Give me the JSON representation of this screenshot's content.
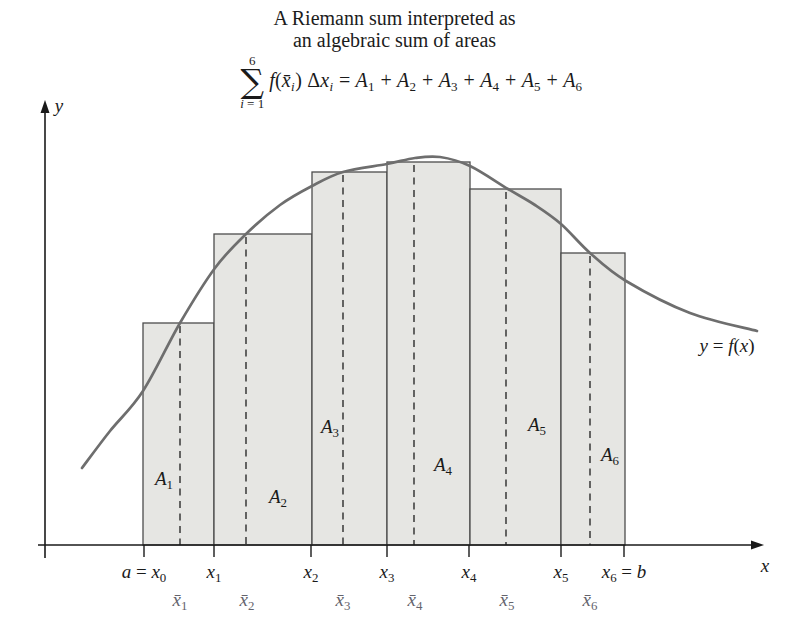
{
  "title": {
    "line1": "A Riemann sum interpreted as",
    "line2": "an algebraic sum of areas"
  },
  "formula": {
    "sum_upper": "6",
    "sum_symbol": "∑",
    "sum_lower_parts": [
      {
        "t": "i",
        "i": 1
      },
      {
        "t": " = 1"
      }
    ],
    "parts": [
      {
        "t": "f",
        "i": 1
      },
      {
        "t": "("
      },
      {
        "t": "x̄",
        "i": 1
      },
      {
        "t": "i",
        "i": 1,
        "sub": 1
      },
      {
        "t": ") "
      },
      {
        "t": "Δ"
      },
      {
        "t": "x",
        "i": 1
      },
      {
        "t": "i",
        "i": 1,
        "sub": 1
      },
      {
        "t": " = "
      },
      {
        "t": "A",
        "i": 1
      },
      {
        "t": "1",
        "sub": 1
      },
      {
        "t": " + "
      },
      {
        "t": "A",
        "i": 1
      },
      {
        "t": "2",
        "sub": 1
      },
      {
        "t": " + "
      },
      {
        "t": "A",
        "i": 1
      },
      {
        "t": "3",
        "sub": 1
      },
      {
        "t": " + "
      },
      {
        "t": "A",
        "i": 1
      },
      {
        "t": "4",
        "sub": 1
      },
      {
        "t": " + "
      },
      {
        "t": "A",
        "i": 1
      },
      {
        "t": "5",
        "sub": 1
      },
      {
        "t": " + "
      },
      {
        "t": "A",
        "i": 1
      },
      {
        "t": "6",
        "sub": 1
      }
    ]
  },
  "diagram": {
    "width": 789,
    "height": 623,
    "colors": {
      "bar_fill": "#e6e6e3",
      "bar_stroke": "#4d4d4d",
      "curve": "#6e6e6e",
      "dash": "#2b2b2b",
      "axis": "#1a1a1a",
      "text": "#1a1a1a",
      "sample_label": "#64646d"
    },
    "baseline_y": 545,
    "axis": {
      "y": {
        "x": 45,
        "top": 110,
        "bottom": 558,
        "arrow_tip_y": 100,
        "label_parts": [
          {
            "t": "y",
            "i": 1
          }
        ],
        "label_x": 59,
        "label_y": 112
      },
      "x": {
        "y": 545,
        "left": 38,
        "right": 753,
        "arrow_tip_x": 764,
        "label_parts": [
          {
            "t": "x",
            "i": 1
          }
        ],
        "label_x": 765,
        "label_y": 572
      }
    },
    "tick_len": 12,
    "bars": [
      {
        "id": "A1",
        "left": 143,
        "right": 214,
        "top": 323,
        "sample_x": 180,
        "label_parts": [
          {
            "t": "A",
            "i": 1
          },
          {
            "t": "1",
            "sub": 1
          }
        ],
        "label_x": 164,
        "label_y": 485
      },
      {
        "id": "A2",
        "left": 214,
        "right": 312,
        "top": 234,
        "sample_x": 246,
        "label_parts": [
          {
            "t": "A",
            "i": 1
          },
          {
            "t": "2",
            "sub": 1
          }
        ],
        "label_x": 278,
        "label_y": 503
      },
      {
        "id": "A3",
        "left": 312,
        "right": 387,
        "top": 172,
        "sample_x": 343,
        "label_parts": [
          {
            "t": "A",
            "i": 1
          },
          {
            "t": "3",
            "sub": 1
          }
        ],
        "label_x": 330,
        "label_y": 433
      },
      {
        "id": "A4",
        "left": 387,
        "right": 470,
        "top": 162,
        "sample_x": 414,
        "label_parts": [
          {
            "t": "A",
            "i": 1
          },
          {
            "t": "4",
            "sub": 1
          }
        ],
        "label_x": 443,
        "label_y": 471
      },
      {
        "id": "A5",
        "left": 470,
        "right": 561,
        "top": 189,
        "sample_x": 506,
        "label_parts": [
          {
            "t": "A",
            "i": 1
          },
          {
            "t": "5",
            "sub": 1
          }
        ],
        "label_x": 537,
        "label_y": 431
      },
      {
        "id": "A6",
        "left": 561,
        "right": 625,
        "top": 253,
        "sample_x": 590,
        "label_parts": [
          {
            "t": "A",
            "i": 1
          },
          {
            "t": "6",
            "sub": 1
          }
        ],
        "label_x": 610,
        "label_y": 461
      }
    ],
    "x_ticks": [
      {
        "x": 144,
        "label_parts": [
          {
            "t": "a",
            "i": 1
          },
          {
            "t": " = "
          },
          {
            "t": "x",
            "i": 1
          },
          {
            "t": "0",
            "sub": 1
          }
        ]
      },
      {
        "x": 214,
        "label_parts": [
          {
            "t": "x",
            "i": 1
          },
          {
            "t": "1",
            "sub": 1
          }
        ]
      },
      {
        "x": 311,
        "label_parts": [
          {
            "t": "x",
            "i": 1
          },
          {
            "t": "2",
            "sub": 1
          }
        ]
      },
      {
        "x": 387,
        "label_parts": [
          {
            "t": "x",
            "i": 1
          },
          {
            "t": "3",
            "sub": 1
          }
        ]
      },
      {
        "x": 469,
        "label_parts": [
          {
            "t": "x",
            "i": 1
          },
          {
            "t": "4",
            "sub": 1
          }
        ]
      },
      {
        "x": 561,
        "label_parts": [
          {
            "t": "x",
            "i": 1
          },
          {
            "t": "5",
            "sub": 1
          }
        ]
      },
      {
        "x": 624,
        "label_parts": [
          {
            "t": "x",
            "i": 1
          },
          {
            "t": "6",
            "sub": 1
          },
          {
            "t": " = "
          },
          {
            "t": "b",
            "i": 1
          }
        ]
      }
    ],
    "tick_label_y": 578,
    "sample_label_y": 606,
    "sample_labels": [
      {
        "x": 180,
        "label_parts": [
          {
            "t": "x̄",
            "i": 1
          },
          {
            "t": "1",
            "sub": 1
          }
        ]
      },
      {
        "x": 247,
        "label_parts": [
          {
            "t": "x̄",
            "i": 1
          },
          {
            "t": "2",
            "sub": 1
          }
        ]
      },
      {
        "x": 343,
        "label_parts": [
          {
            "t": "x̄",
            "i": 1
          },
          {
            "t": "3",
            "sub": 1
          }
        ]
      },
      {
        "x": 415,
        "label_parts": [
          {
            "t": "x̄",
            "i": 1
          },
          {
            "t": "4",
            "sub": 1
          }
        ]
      },
      {
        "x": 507,
        "label_parts": [
          {
            "t": "x̄",
            "i": 1
          },
          {
            "t": "5",
            "sub": 1
          }
        ]
      },
      {
        "x": 590,
        "label_parts": [
          {
            "t": "x̄",
            "i": 1
          },
          {
            "t": "6",
            "sub": 1
          }
        ]
      }
    ],
    "curve": {
      "points": [
        [
          82,
          468
        ],
        [
          110,
          431
        ],
        [
          143,
          391
        ],
        [
          180,
          323
        ],
        [
          215,
          268
        ],
        [
          246,
          234
        ],
        [
          280,
          205
        ],
        [
          312,
          186
        ],
        [
          343,
          172
        ],
        [
          387,
          164
        ],
        [
          415,
          158
        ],
        [
          440,
          157
        ],
        [
          470,
          166
        ],
        [
          508,
          189
        ],
        [
          535,
          205
        ],
        [
          561,
          224
        ],
        [
          590,
          253
        ],
        [
          626,
          281
        ],
        [
          690,
          313
        ],
        [
          757,
          331
        ]
      ],
      "label_parts": [
        {
          "t": "y",
          "i": 1
        },
        {
          "t": " = "
        },
        {
          "t": "f",
          "i": 1
        },
        {
          "t": "("
        },
        {
          "t": "x",
          "i": 1
        },
        {
          "t": ")"
        }
      ],
      "label_x": 727,
      "label_y": 352
    }
  }
}
